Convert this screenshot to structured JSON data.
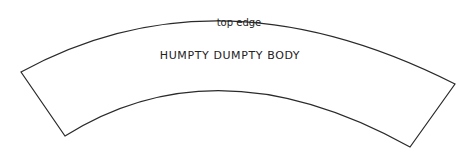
{
  "diagram": {
    "edge_label": "top edge",
    "body_label": "HUMPTY DUMPTY BODY",
    "stroke_color": "#2a2a2a",
    "fill_color": "#ffffff",
    "background": "#ffffff"
  }
}
